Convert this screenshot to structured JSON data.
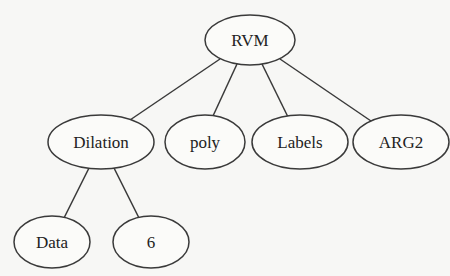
{
  "diagram": {
    "type": "tree",
    "nodes": [
      {
        "id": "rvm",
        "label": "RVM",
        "cx": 250,
        "cy": 40,
        "rx": 45,
        "ry": 25
      },
      {
        "id": "dilation",
        "label": "Dilation",
        "cx": 101,
        "cy": 142,
        "rx": 53,
        "ry": 27
      },
      {
        "id": "poly",
        "label": "poly",
        "cx": 205,
        "cy": 142,
        "rx": 40,
        "ry": 27
      },
      {
        "id": "labels",
        "label": "Labels",
        "cx": 300,
        "cy": 142,
        "rx": 48,
        "ry": 27
      },
      {
        "id": "arg2",
        "label": "ARG2",
        "cx": 401,
        "cy": 142,
        "rx": 48,
        "ry": 27
      },
      {
        "id": "data",
        "label": "Data",
        "cx": 52,
        "cy": 242,
        "rx": 38,
        "ry": 26
      },
      {
        "id": "six",
        "label": "6",
        "cx": 151,
        "cy": 242,
        "rx": 38,
        "ry": 26
      }
    ],
    "edges": [
      {
        "from": "rvm",
        "to": "dilation",
        "x1": 220,
        "y1": 59,
        "x2": 130,
        "y2": 120
      },
      {
        "from": "rvm",
        "to": "poly",
        "x1": 237,
        "y1": 64,
        "x2": 213,
        "y2": 116
      },
      {
        "from": "rvm",
        "to": "labels",
        "x1": 262,
        "y1": 64,
        "x2": 288,
        "y2": 117
      },
      {
        "from": "rvm",
        "to": "arg2",
        "x1": 280,
        "y1": 59,
        "x2": 371,
        "y2": 121
      },
      {
        "from": "dilation",
        "to": "data",
        "x1": 89,
        "y1": 168,
        "x2": 64,
        "y2": 218
      },
      {
        "from": "dilation",
        "to": "six",
        "x1": 114,
        "y1": 168,
        "x2": 139,
        "y2": 218
      }
    ],
    "colors": {
      "stroke": "#3a3a3a",
      "text": "#222222",
      "background": "#f7f7f5"
    }
  }
}
